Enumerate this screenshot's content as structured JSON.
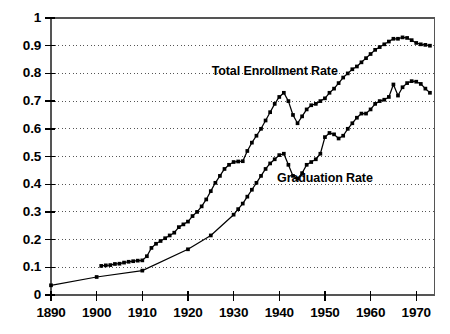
{
  "chart_data": {
    "type": "line",
    "title": "",
    "xlabel": "",
    "ylabel": "",
    "xlim": [
      1890,
      1974
    ],
    "ylim": [
      0,
      1
    ],
    "grid": true,
    "grid_style": "dotted horizontal",
    "legend_position": "inline annotations",
    "xticks": [
      1890,
      1900,
      1910,
      1920,
      1930,
      1940,
      1950,
      1960,
      1970
    ],
    "xtick_labels": [
      "1890",
      "1900",
      "1910",
      "1920",
      "1930",
      "1940",
      "1950",
      "1960",
      "1970"
    ],
    "yticks": [
      0,
      0.1,
      0.2,
      0.3,
      0.4,
      0.5,
      0.6,
      0.7,
      0.8,
      0.9,
      1
    ],
    "ytick_labels": [
      "0",
      "0.1",
      "0.2",
      "0.3",
      "0.4",
      "0.5",
      "0.6",
      "0.7",
      "0.8",
      "0.9",
      "1"
    ],
    "annotations": [
      {
        "text": "Total Enrollment Rate",
        "x": 1939,
        "y": 0.805
      },
      {
        "text": "Graduation Rate",
        "x": 1950,
        "y": 0.42
      }
    ],
    "series": [
      {
        "name": "Total Enrollment Rate",
        "marker": "square",
        "color": "#000000",
        "x": [
          1901,
          1902,
          1903,
          1904,
          1905,
          1906,
          1907,
          1908,
          1909,
          1910,
          1911,
          1912,
          1913,
          1914,
          1915,
          1916,
          1917,
          1918,
          1919,
          1920,
          1921,
          1922,
          1923,
          1924,
          1925,
          1926,
          1927,
          1928,
          1929,
          1930,
          1931,
          1932,
          1933,
          1934,
          1935,
          1936,
          1937,
          1938,
          1939,
          1940,
          1941,
          1942,
          1943,
          1944,
          1945,
          1946,
          1947,
          1948,
          1949,
          1950,
          1951,
          1952,
          1953,
          1954,
          1955,
          1956,
          1957,
          1958,
          1959,
          1960,
          1961,
          1962,
          1963,
          1964,
          1965,
          1966,
          1967,
          1968,
          1969,
          1970,
          1971,
          1972,
          1973
        ],
        "y": [
          0.105,
          0.107,
          0.108,
          0.112,
          0.113,
          0.117,
          0.12,
          0.122,
          0.124,
          0.125,
          0.14,
          0.17,
          0.185,
          0.195,
          0.205,
          0.215,
          0.225,
          0.245,
          0.255,
          0.265,
          0.285,
          0.3,
          0.32,
          0.345,
          0.375,
          0.405,
          0.43,
          0.455,
          0.47,
          0.48,
          0.482,
          0.483,
          0.52,
          0.55,
          0.575,
          0.6,
          0.63,
          0.66,
          0.69,
          0.715,
          0.73,
          0.7,
          0.65,
          0.62,
          0.645,
          0.67,
          0.685,
          0.69,
          0.7,
          0.71,
          0.73,
          0.745,
          0.765,
          0.785,
          0.8,
          0.815,
          0.825,
          0.84,
          0.855,
          0.87,
          0.885,
          0.895,
          0.905,
          0.915,
          0.925,
          0.925,
          0.93,
          0.928,
          0.92,
          0.91,
          0.905,
          0.903,
          0.9
        ]
      },
      {
        "name": "Graduation Rate",
        "marker": "square",
        "color": "#000000",
        "x": [
          1890,
          1900,
          1910,
          1920,
          1925,
          1930,
          1931,
          1932,
          1933,
          1934,
          1935,
          1936,
          1937,
          1938,
          1939,
          1940,
          1941,
          1942,
          1943,
          1944,
          1945,
          1946,
          1947,
          1948,
          1949,
          1950,
          1951,
          1952,
          1953,
          1954,
          1955,
          1956,
          1957,
          1958,
          1959,
          1960,
          1961,
          1962,
          1963,
          1964,
          1965,
          1966,
          1967,
          1968,
          1969,
          1970,
          1971,
          1972,
          1973
        ],
        "y": [
          0.035,
          0.065,
          0.088,
          0.165,
          0.215,
          0.29,
          0.31,
          0.33,
          0.355,
          0.38,
          0.405,
          0.43,
          0.455,
          0.475,
          0.49,
          0.505,
          0.51,
          0.47,
          0.43,
          0.42,
          0.44,
          0.47,
          0.48,
          0.49,
          0.51,
          0.57,
          0.585,
          0.58,
          0.565,
          0.575,
          0.6,
          0.62,
          0.64,
          0.655,
          0.655,
          0.67,
          0.69,
          0.7,
          0.705,
          0.715,
          0.76,
          0.72,
          0.75,
          0.765,
          0.772,
          0.77,
          0.762,
          0.745,
          0.73
        ]
      }
    ]
  },
  "axes": {
    "frame_color": "#555555",
    "grid_color": "#555555",
    "tick_color": "#000000"
  }
}
